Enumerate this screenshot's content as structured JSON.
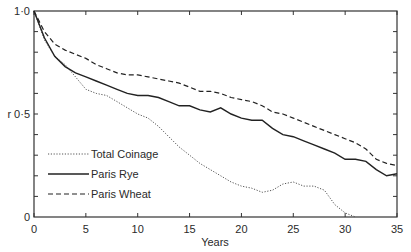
{
  "chart_data": {
    "type": "line",
    "title": "",
    "xlabel": "Years",
    "ylabel": "r",
    "xlim": [
      0,
      35
    ],
    "ylim": [
      0,
      1
    ],
    "x_ticks": [
      0,
      5,
      10,
      15,
      20,
      25,
      30,
      35
    ],
    "x_tick_labels": [
      "0",
      "5",
      "10",
      "15",
      "20",
      "25",
      "30",
      "35"
    ],
    "y_tick_labels": [
      {
        "value": 0,
        "label": "0"
      },
      {
        "value": 0.5,
        "label": "r 0·5"
      },
      {
        "value": 1.0,
        "label": "1·0"
      }
    ],
    "y_minor_ticks": [
      0.1,
      0.2,
      0.3,
      0.4,
      0.5,
      0.6,
      0.7,
      0.8,
      0.9
    ],
    "grid": false,
    "legend_position": "lower-left inside",
    "series": [
      {
        "name": "Total Coinage",
        "style": "dotted",
        "x": [
          0,
          1,
          2,
          3,
          4,
          5,
          6,
          7,
          8,
          9,
          10,
          11,
          12,
          13,
          14,
          15,
          16,
          17,
          18,
          19,
          20,
          21,
          22,
          23,
          24,
          25,
          26,
          27,
          28,
          29,
          30,
          31
        ],
        "values": [
          1.0,
          0.86,
          0.78,
          0.74,
          0.68,
          0.62,
          0.6,
          0.59,
          0.56,
          0.53,
          0.5,
          0.48,
          0.44,
          0.39,
          0.34,
          0.3,
          0.26,
          0.23,
          0.2,
          0.17,
          0.15,
          0.14,
          0.12,
          0.13,
          0.16,
          0.17,
          0.15,
          0.15,
          0.13,
          0.06,
          0.02,
          0.0
        ]
      },
      {
        "name": "Paris Rye",
        "style": "solid",
        "x": [
          0,
          1,
          2,
          3,
          4,
          5,
          6,
          7,
          8,
          9,
          10,
          11,
          12,
          13,
          14,
          15,
          16,
          17,
          18,
          19,
          20,
          21,
          22,
          23,
          24,
          25,
          26,
          27,
          28,
          29,
          30,
          31,
          32,
          33,
          34,
          35
        ],
        "values": [
          1.0,
          0.87,
          0.78,
          0.73,
          0.7,
          0.68,
          0.66,
          0.64,
          0.62,
          0.6,
          0.59,
          0.59,
          0.58,
          0.56,
          0.54,
          0.54,
          0.52,
          0.51,
          0.53,
          0.5,
          0.48,
          0.47,
          0.47,
          0.43,
          0.4,
          0.39,
          0.37,
          0.35,
          0.33,
          0.31,
          0.28,
          0.28,
          0.27,
          0.23,
          0.2,
          0.21
        ]
      },
      {
        "name": "Paris Wheat",
        "style": "dashed",
        "x": [
          0,
          1,
          2,
          3,
          4,
          5,
          6,
          7,
          8,
          9,
          10,
          11,
          12,
          13,
          14,
          15,
          16,
          17,
          18,
          19,
          20,
          21,
          22,
          23,
          24,
          25,
          26,
          27,
          28,
          29,
          30,
          31,
          32,
          33,
          34,
          35
        ],
        "values": [
          1.0,
          0.9,
          0.84,
          0.81,
          0.79,
          0.77,
          0.74,
          0.72,
          0.7,
          0.69,
          0.69,
          0.68,
          0.67,
          0.66,
          0.65,
          0.63,
          0.61,
          0.61,
          0.6,
          0.58,
          0.57,
          0.56,
          0.54,
          0.51,
          0.5,
          0.48,
          0.46,
          0.44,
          0.42,
          0.4,
          0.38,
          0.36,
          0.33,
          0.28,
          0.26,
          0.25
        ]
      }
    ]
  }
}
